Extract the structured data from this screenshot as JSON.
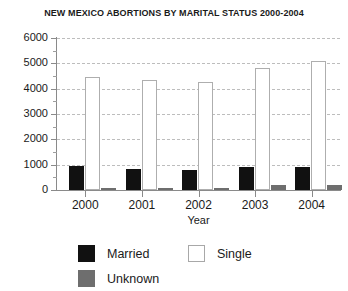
{
  "chart_data": {
    "type": "bar",
    "title": "NEW MEXICO ABORTIONS BY MARITAL STATUS 2000-2004",
    "xlabel": "Year",
    "ylabel": "",
    "categories": [
      "2000",
      "2001",
      "2002",
      "2003",
      "2004"
    ],
    "series": [
      {
        "name": "Married",
        "color": "#111111",
        "values": [
          930,
          830,
          780,
          900,
          920
        ]
      },
      {
        "name": "Single",
        "color": "#ffffff",
        "values": [
          4450,
          4350,
          4250,
          4800,
          5100
        ]
      },
      {
        "name": "Unknown",
        "color": "#6e6e6e",
        "values": [
          70,
          90,
          60,
          210,
          190
        ]
      }
    ],
    "ylim": [
      0,
      6000
    ],
    "ytick_labels": [
      "0",
      "1000",
      "2000",
      "3000",
      "4000",
      "5000",
      "6000"
    ],
    "ytick_values": [
      0,
      1000,
      2000,
      3000,
      4000,
      5000,
      6000
    ],
    "yminor_values": [
      500,
      1500,
      2500,
      3500,
      4500,
      5500
    ],
    "grid": true,
    "legend_position": "bottom"
  },
  "legend": {
    "entries": [
      {
        "label": "Married",
        "swatch": "married"
      },
      {
        "label": "Single",
        "swatch": "single"
      },
      {
        "label": "Unknown",
        "swatch": "unknown"
      }
    ]
  }
}
